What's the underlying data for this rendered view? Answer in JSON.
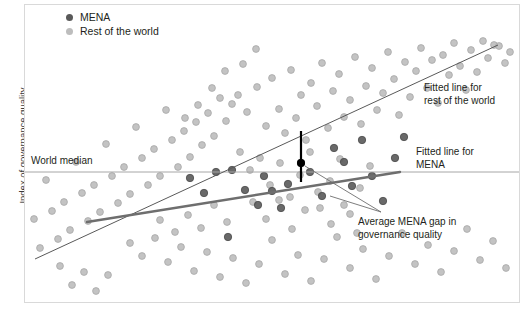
{
  "chart_data": {
    "type": "scatter",
    "title": "",
    "xlabel": "",
    "ylabel": "Index of governance quality",
    "xlim": [
      0,
      100
    ],
    "ylim": [
      0,
      100
    ],
    "grid": false,
    "legend_position": "top-left",
    "colors": {
      "mena": "#595959",
      "rest_of_world": "#bdbdbd",
      "fit_world_line": "#595959",
      "fit_mena_line": "#6e6e6e",
      "median_line": "#a6a6a6",
      "gap_line": "#000000",
      "frame": "#d9d9d9",
      "text": "#231f20"
    },
    "legend": [
      {
        "key": "mena",
        "label": "MENA",
        "marker": "dot-dark"
      },
      {
        "key": "rest_of_world",
        "label": "Rest of the world",
        "marker": "dot-light"
      }
    ],
    "annotations": [
      {
        "key": "world_median",
        "text": "World median"
      },
      {
        "key": "fit_world",
        "text": "Fitted line for\nrest of the world"
      },
      {
        "key": "fit_mena",
        "text": "Fitted line for\nMENA"
      },
      {
        "key": "gap",
        "text": "Average MENA gap in\ngovernance quality"
      }
    ],
    "reference_lines": {
      "world_median": {
        "orientation": "horizontal",
        "y": 172,
        "x_start": 25,
        "x_end": 519
      },
      "fit_rest_of_world": {
        "x1": 35,
        "y1": 259,
        "x2": 498,
        "y2": 45
      },
      "fit_mena": {
        "x1": 87,
        "y1": 222,
        "x2": 400,
        "y2": 172
      },
      "gap_marker": {
        "x": 301,
        "y_top": 131,
        "y_bottom": 182,
        "dot_y": 163
      }
    },
    "leader_lines": [
      {
        "from_x": 305,
        "from_y": 166,
        "to_x": 381,
        "to_y": 212
      },
      {
        "from_x": 330,
        "from_y": 196,
        "to_x": 381,
        "to_y": 212
      }
    ],
    "series": [
      {
        "name": "Rest of the world",
        "key": "rest_of_world",
        "n": 150,
        "points": [
          [
            238,
            95
          ],
          [
            247,
            112
          ],
          [
            257,
            87
          ],
          [
            266,
            126
          ],
          [
            272,
            78
          ],
          [
            279,
            109
          ],
          [
            285,
            133
          ],
          [
            291,
            70
          ],
          [
            296,
            118
          ],
          [
            301,
            95
          ],
          [
            306,
            140
          ],
          [
            311,
            83
          ],
          [
            317,
            106
          ],
          [
            322,
            63
          ],
          [
            328,
            128
          ],
          [
            333,
            91
          ],
          [
            339,
            74
          ],
          [
            344,
            117
          ],
          [
            350,
            100
          ],
          [
            355,
            57
          ],
          [
            361,
            124
          ],
          [
            366,
            86
          ],
          [
            372,
            68
          ],
          [
            377,
            110
          ],
          [
            383,
            93
          ],
          [
            388,
            52
          ],
          [
            394,
            79
          ],
          [
            399,
            115
          ],
          [
            405,
            62
          ],
          [
            410,
            97
          ],
          [
            416,
            71
          ],
          [
            421,
            48
          ],
          [
            427,
            88
          ],
          [
            432,
            60
          ],
          [
            438,
            103
          ],
          [
            443,
            55
          ],
          [
            449,
            75
          ],
          [
            454,
            43
          ],
          [
            460,
            66
          ],
          [
            466,
            90
          ],
          [
            471,
            50
          ],
          [
            477,
            72
          ],
          [
            483,
            41
          ],
          [
            488,
            58
          ],
          [
            494,
            45
          ],
          [
            499,
            46
          ],
          [
            505,
            63
          ],
          [
            510,
            52
          ],
          [
            232,
            104
          ],
          [
            226,
            121
          ],
          [
            220,
            98
          ],
          [
            214,
            136
          ],
          [
            208,
            113
          ],
          [
            202,
            145
          ],
          [
            196,
            122
          ],
          [
            190,
            157
          ],
          [
            184,
            131
          ],
          [
            178,
            167
          ],
          [
            172,
            140
          ],
          [
            166,
            110
          ],
          [
            160,
            176
          ],
          [
            154,
            149
          ],
          [
            148,
            185
          ],
          [
            142,
            158
          ],
          [
            136,
            127
          ],
          [
            130,
            194
          ],
          [
            124,
            167
          ],
          [
            118,
            203
          ],
          [
            112,
            176
          ],
          [
            106,
            144
          ],
          [
            100,
            212
          ],
          [
            94,
            185
          ],
          [
            88,
            221
          ],
          [
            82,
            193
          ],
          [
            76,
            162
          ],
          [
            70,
            230
          ],
          [
            64,
            202
          ],
          [
            58,
            239
          ],
          [
            52,
            211
          ],
          [
            46,
            180
          ],
          [
            40,
            248
          ],
          [
            34,
            219
          ],
          [
            240,
            152
          ],
          [
            250,
            170
          ],
          [
            260,
            158
          ],
          [
            270,
            185
          ],
          [
            280,
            163
          ],
          [
            290,
            197
          ],
          [
            300,
            175
          ],
          [
            310,
            152
          ],
          [
            320,
            208
          ],
          [
            330,
            181
          ],
          [
            340,
            159
          ],
          [
            350,
            214
          ],
          [
            360,
            188
          ],
          [
            370,
            166
          ],
          [
            130,
            243
          ],
          [
            142,
            256
          ],
          [
            155,
            238
          ],
          [
            168,
            262
          ],
          [
            181,
            247
          ],
          [
            194,
            271
          ],
          [
            207,
            252
          ],
          [
            220,
            277
          ],
          [
            233,
            258
          ],
          [
            246,
            283
          ],
          [
            259,
            264
          ],
          [
            272,
            240
          ],
          [
            285,
            274
          ],
          [
            298,
            255
          ],
          [
            311,
            281
          ],
          [
            324,
            259
          ],
          [
            337,
            237
          ],
          [
            350,
            268
          ],
          [
            363,
            249
          ],
          [
            376,
            279
          ],
          [
            389,
            256
          ],
          [
            402,
            233
          ],
          [
            415,
            264
          ],
          [
            428,
            245
          ],
          [
            441,
            272
          ],
          [
            454,
            251
          ],
          [
            467,
            229
          ],
          [
            480,
            260
          ],
          [
            493,
            241
          ],
          [
            506,
            268
          ],
          [
            60,
            266
          ],
          [
            72,
            285
          ],
          [
            84,
            272
          ],
          [
            96,
            291
          ],
          [
            108,
            275
          ],
          [
            160,
            220
          ],
          [
            175,
            232
          ],
          [
            188,
            215
          ],
          [
            201,
            228
          ],
          [
            214,
            205
          ],
          [
            227,
            222
          ],
          [
            253,
            202
          ],
          [
            266,
            219
          ],
          [
            279,
            200
          ],
          [
            292,
            229
          ],
          [
            305,
            210
          ],
          [
            318,
            192
          ],
          [
            331,
            224
          ],
          [
            344,
            205
          ],
          [
            357,
            233
          ],
          [
            212,
            88
          ],
          [
            225,
            71
          ],
          [
            198,
            105
          ],
          [
            185,
            118
          ],
          [
            243,
            64
          ],
          [
            256,
            49
          ]
        ]
      },
      {
        "name": "MENA",
        "key": "mena",
        "n": 22,
        "points": [
          [
            190,
            178
          ],
          [
            204,
            193
          ],
          [
            216,
            172
          ],
          [
            232,
            170
          ],
          [
            245,
            190
          ],
          [
            258,
            205
          ],
          [
            264,
            176
          ],
          [
            272,
            191
          ],
          [
            281,
            208
          ],
          [
            288,
            184
          ],
          [
            301,
            163
          ],
          [
            310,
            172
          ],
          [
            322,
            196
          ],
          [
            334,
            148
          ],
          [
            344,
            162
          ],
          [
            352,
            186
          ],
          [
            362,
            140
          ],
          [
            372,
            176
          ],
          [
            383,
            201
          ],
          [
            395,
            158
          ],
          [
            404,
            137
          ],
          [
            228,
            237
          ]
        ]
      }
    ]
  },
  "legend_items": [
    {
      "label": "MENA"
    },
    {
      "label": "Rest of the world"
    }
  ],
  "annotations": {
    "world_median": "World median",
    "fit_world": "Fitted line for\nrest of the world",
    "fit_mena": "Fitted line for\nMENA",
    "gap": "Average MENA gap in\ngovernance quality"
  },
  "axis": {
    "y_title": "Index of governance quality"
  }
}
